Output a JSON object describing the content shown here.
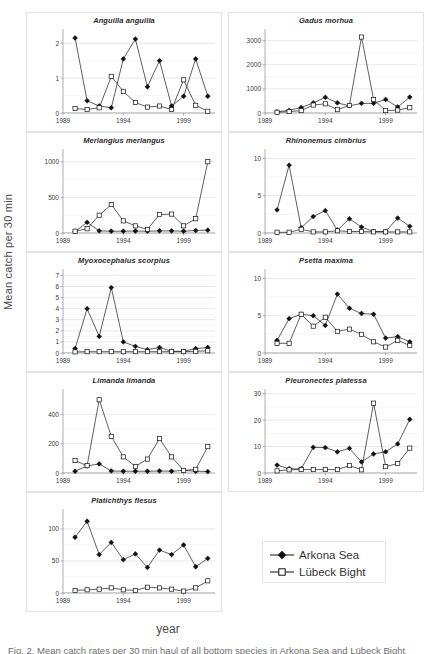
{
  "figure": {
    "ylabel": "Mean catch per 30 min",
    "xlabel": "year",
    "caption": "Fig. 2. Mean catch rates per 30 min haul of all bottom species in Arkona Sea and Lübeck Bight"
  },
  "legend": {
    "title": "",
    "entries": [
      {
        "label": "Arkona Sea",
        "marker": "filled-diamond",
        "color": "#111111"
      },
      {
        "label": "Lübeck Bight",
        "marker": "open-square",
        "color": "#111111"
      }
    ]
  },
  "chart_data": [
    {
      "type": "line",
      "title": "Anguilla anguilla",
      "xlabel": "year",
      "ylabel": "Mean catch per 30 min",
      "x": [
        1990,
        1991,
        1992,
        1993,
        1994,
        1995,
        1996,
        1997,
        1998,
        1999,
        2000,
        2001
      ],
      "xlim": [
        1989,
        2001.6
      ],
      "ylim": [
        0,
        2.35
      ],
      "xticks": [
        1989,
        1994,
        1999
      ],
      "yticks": [
        0,
        1,
        2
      ],
      "grid": true,
      "series": [
        {
          "name": "Arkona Sea",
          "values": [
            2.15,
            0.35,
            0.2,
            0.15,
            1.55,
            2.12,
            0.75,
            1.5,
            0.2,
            0.48,
            1.55,
            0.48
          ]
        },
        {
          "name": "Lübeck Bight",
          "values": [
            0.13,
            0.1,
            0.15,
            1.05,
            0.62,
            0.3,
            0.17,
            0.2,
            0.1,
            0.95,
            0.22,
            0.05
          ]
        }
      ]
    },
    {
      "type": "line",
      "title": "Gadus morhua",
      "xlabel": "year",
      "ylabel": "Mean catch per 30 min",
      "x": [
        1990,
        1991,
        1992,
        1993,
        1994,
        1995,
        1996,
        1997,
        1998,
        1999,
        2000,
        2001
      ],
      "xlim": [
        1989,
        2001.6
      ],
      "ylim": [
        0,
        3400
      ],
      "xticks": [
        1989,
        1994,
        1999
      ],
      "yticks": [
        0,
        1000,
        2000,
        3000
      ],
      "grid": true,
      "series": [
        {
          "name": "Arkona Sea",
          "values": [
            50,
            110,
            230,
            420,
            650,
            420,
            300,
            400,
            400,
            560,
            250,
            660
          ]
        },
        {
          "name": "Lübeck Bight",
          "values": [
            30,
            60,
            100,
            330,
            380,
            140,
            310,
            3150,
            560,
            100,
            120,
            220
          ]
        }
      ]
    },
    {
      "type": "line",
      "title": "Merlangius merlangus",
      "xlabel": "year",
      "ylabel": "Mean catch per 30 min",
      "x": [
        1990,
        1991,
        1992,
        1993,
        1994,
        1995,
        1996,
        1997,
        1998,
        1999,
        2000,
        2001
      ],
      "xlim": [
        1989,
        2001.6
      ],
      "ylim": [
        0,
        1150
      ],
      "xticks": [
        1989,
        1994,
        1999
      ],
      "yticks": [
        0,
        500,
        1000
      ],
      "grid": true,
      "series": [
        {
          "name": "Arkona Sea",
          "values": [
            20,
            150,
            30,
            25,
            25,
            28,
            25,
            30,
            30,
            25,
            35,
            40
          ]
        },
        {
          "name": "Lübeck Bight",
          "values": [
            25,
            60,
            250,
            400,
            170,
            100,
            50,
            260,
            265,
            100,
            200,
            1000
          ]
        }
      ]
    },
    {
      "type": "line",
      "title": "Rhinonemus cimbrius",
      "xlabel": "year",
      "ylabel": "Mean catch per 30 min",
      "x": [
        1990,
        1991,
        1992,
        1993,
        1994,
        1995,
        1996,
        1997,
        1998,
        1999,
        2000,
        2001
      ],
      "xlim": [
        1989,
        2001.6
      ],
      "ylim": [
        0,
        11
      ],
      "xticks": [
        1989,
        1994,
        1999
      ],
      "yticks": [
        0,
        5,
        10
      ],
      "grid": true,
      "series": [
        {
          "name": "Arkona Sea",
          "values": [
            3.1,
            9.1,
            0.7,
            2.2,
            3.0,
            0.4,
            1.9,
            0.8,
            0.2,
            0.2,
            2.0,
            0.9
          ]
        },
        {
          "name": "Lübeck Bight",
          "values": [
            0.1,
            0.1,
            0.5,
            0.15,
            0.15,
            0.3,
            0.2,
            0.2,
            0.15,
            0.15,
            0.15,
            0.15
          ]
        }
      ]
    },
    {
      "type": "line",
      "title": "Myoxocephalus scorpius",
      "xlabel": "year",
      "ylabel": "Mean catch per 30 min",
      "x": [
        1990,
        1991,
        1992,
        1993,
        1994,
        1995,
        1996,
        1997,
        1998,
        1999,
        2000,
        2001
      ],
      "xlim": [
        1989,
        2001.6
      ],
      "ylim": [
        0,
        7.4
      ],
      "xticks": [
        1989,
        1994,
        1999
      ],
      "yticks": [
        0,
        1,
        2,
        3,
        4,
        5,
        6,
        7
      ],
      "grid": true,
      "series": [
        {
          "name": "Arkona Sea",
          "values": [
            0.4,
            4.0,
            1.5,
            5.9,
            1.0,
            0.6,
            0.3,
            0.5,
            0.15,
            0.15,
            0.4,
            0.5
          ]
        },
        {
          "name": "Lübeck Bight",
          "values": [
            0.1,
            0.12,
            0.12,
            0.12,
            0.12,
            0.12,
            0.12,
            0.12,
            0.12,
            0.12,
            0.15,
            0.2
          ]
        }
      ]
    },
    {
      "type": "line",
      "title": "Psetta maxima",
      "xlabel": "year",
      "ylabel": "Mean catch per 30 min",
      "x": [
        1990,
        1991,
        1992,
        1993,
        1994,
        1995,
        1996,
        1997,
        1998,
        1999,
        2000,
        2001
      ],
      "xlim": [
        1989,
        2001.6
      ],
      "ylim": [
        0,
        11
      ],
      "xticks": [
        1989,
        1994,
        1999
      ],
      "yticks": [
        0,
        5,
        10
      ],
      "grid": true,
      "series": [
        {
          "name": "Arkona Sea",
          "values": [
            1.7,
            4.6,
            5.2,
            5.0,
            3.7,
            7.9,
            6.0,
            5.3,
            5.2,
            2.0,
            2.2,
            1.5
          ]
        },
        {
          "name": "Lübeck Bight",
          "values": [
            1.3,
            1.3,
            5.2,
            3.6,
            4.8,
            2.9,
            3.2,
            2.5,
            1.5,
            0.8,
            1.7,
            1.0
          ]
        }
      ]
    },
    {
      "type": "line",
      "title": "Limanda limanda",
      "xlabel": "year",
      "ylabel": "Mean catch per 30 min",
      "x": [
        1990,
        1991,
        1992,
        1993,
        1994,
        1995,
        1996,
        1997,
        1998,
        1999,
        2000,
        2001
      ],
      "xlim": [
        1989,
        2001.6
      ],
      "ylim": [
        0,
        560
      ],
      "xticks": [
        1989,
        1994,
        1999
      ],
      "yticks": [
        0,
        200,
        400
      ],
      "grid": true,
      "series": [
        {
          "name": "Arkona Sea",
          "values": [
            12,
            48,
            62,
            14,
            12,
            12,
            12,
            14,
            12,
            18,
            12,
            10
          ]
        },
        {
          "name": "Lübeck Bight",
          "values": [
            85,
            50,
            500,
            250,
            110,
            45,
            95,
            235,
            110,
            18,
            25,
            180
          ]
        }
      ]
    },
    {
      "type": "line",
      "title": "Pleuronectes platessa",
      "xlabel": "year",
      "ylabel": "Mean catch per 30 min",
      "x": [
        1990,
        1991,
        1992,
        1993,
        1994,
        1995,
        1996,
        1997,
        1998,
        1999,
        2000,
        2001
      ],
      "xlim": [
        1989,
        2001.6
      ],
      "ylim": [
        0,
        31
      ],
      "xticks": [
        1989,
        1994,
        1999
      ],
      "yticks": [
        0,
        10,
        20,
        30
      ],
      "grid": true,
      "series": [
        {
          "name": "Arkona Sea",
          "values": [
            3.0,
            1.6,
            1.6,
            9.7,
            9.6,
            8.0,
            9.3,
            4.2,
            7.2,
            8.0,
            11.0,
            20.3
          ]
        },
        {
          "name": "Lübeck Bight",
          "values": [
            0.8,
            1.2,
            1.3,
            1.3,
            1.3,
            1.3,
            2.8,
            1.2,
            26.4,
            2.4,
            3.6,
            9.4
          ]
        }
      ]
    },
    {
      "type": "line",
      "title": "Platichthys flesus",
      "xlabel": "year",
      "ylabel": "Mean catch per 30 min",
      "x": [
        1990,
        1991,
        1992,
        1993,
        1994,
        1995,
        1996,
        1997,
        1998,
        1999,
        2000,
        2001
      ],
      "xlim": [
        1989,
        2001.6
      ],
      "ylim": [
        0,
        128
      ],
      "xticks": [
        1989,
        1994,
        1999
      ],
      "yticks": [
        0,
        50,
        100
      ],
      "grid": true,
      "series": [
        {
          "name": "Arkona Sea",
          "values": [
            87,
            112,
            60,
            79,
            52,
            61,
            40,
            67,
            60,
            75,
            41,
            54
          ]
        },
        {
          "name": "Lübeck Bight",
          "values": [
            4,
            5,
            6,
            8,
            5,
            4,
            9,
            8,
            6,
            3,
            8,
            19
          ]
        }
      ]
    }
  ]
}
